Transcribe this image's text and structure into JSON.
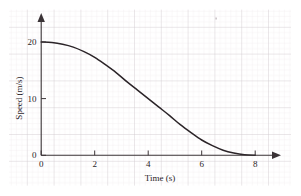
{
  "chart_data": {
    "type": "line",
    "title": "",
    "xlabel": "Time (s)",
    "ylabel": "Speed (m/s)",
    "xlim": [
      0,
      8.8
    ],
    "ylim": [
      0,
      22
    ],
    "xticks": [
      0,
      2,
      4,
      6,
      8
    ],
    "xtick_labels": [
      "0",
      "2",
      "4",
      "6",
      "8"
    ],
    "yticks": [
      0,
      10,
      20
    ],
    "ytick_labels": [
      "0",
      "10",
      "20"
    ],
    "grid": true,
    "grid_style": "graph-paper",
    "legend": "none",
    "axis_arrows": true,
    "series": [
      {
        "name": "Speed vs Time",
        "x": [
          0.0,
          0.4,
          0.8,
          1.2,
          1.6,
          2.0,
          2.4,
          2.8,
          3.2,
          3.6,
          4.0,
          4.4,
          4.8,
          5.2,
          5.6,
          6.0,
          6.4,
          6.8,
          7.2,
          7.6,
          8.0
        ],
        "values": [
          20.0,
          19.9,
          19.6,
          19.1,
          18.3,
          17.3,
          16.0,
          14.6,
          13.0,
          11.5,
          10.0,
          8.5,
          7.0,
          5.4,
          4.0,
          2.7,
          1.7,
          0.9,
          0.4,
          0.1,
          0.0
        ]
      }
    ]
  },
  "axes": {
    "x_label": "Time (s)",
    "y_label": "Speed (m/s)",
    "x_tick_0": "0",
    "x_tick_2": "2",
    "x_tick_4": "4",
    "x_tick_6": "6",
    "x_tick_8": "8",
    "y_tick_0": "0",
    "y_tick_10": "10",
    "y_tick_20": "20"
  },
  "colors": {
    "curve": "#2b2428",
    "axis": "#3a3336",
    "grid_minor": "#e9e2e6",
    "grid_major": "#cfc6cc",
    "background": "#ffffff"
  }
}
